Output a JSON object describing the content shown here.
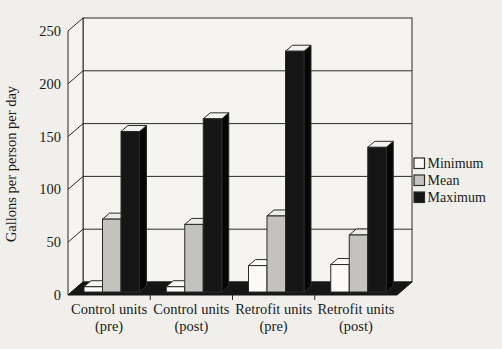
{
  "chart_data": {
    "type": "bar",
    "style": "3d-column-chart",
    "title": "",
    "xlabel": "",
    "ylabel": "Gallons per person per day",
    "ylim": [
      0,
      250
    ],
    "yticks": [
      0,
      50,
      100,
      150,
      200,
      250
    ],
    "grid": "horizontal",
    "legend_position": "right",
    "categories": [
      {
        "line1": "Control units",
        "line2": "(pre)"
      },
      {
        "line1": "Control units",
        "line2": "(post)"
      },
      {
        "line1": "Retrofit units",
        "line2": "(pre)"
      },
      {
        "line1": "Retrofit units",
        "line2": "(post)"
      }
    ],
    "series": [
      {
        "name": "Minimum",
        "values": [
          5,
          5,
          25,
          26
        ],
        "color": "#fbfaf7",
        "top_color": "#fbfaf7",
        "side_color": "#eeede9"
      },
      {
        "name": "Mean",
        "values": [
          69,
          64,
          72,
          54
        ],
        "color": "#c3c2be",
        "top_color": "#ecebe7",
        "side_color": "#9d9c98"
      },
      {
        "name": "Maximum",
        "values": [
          152,
          164,
          228,
          137
        ],
        "color": "#151515",
        "top_color": "#f2f1ed",
        "side_color": "#060606"
      }
    ],
    "colors": {
      "wall": "#f5f4f0",
      "floor": "#161616",
      "line": "#2a2a2a",
      "background": "#f0efeb"
    }
  }
}
